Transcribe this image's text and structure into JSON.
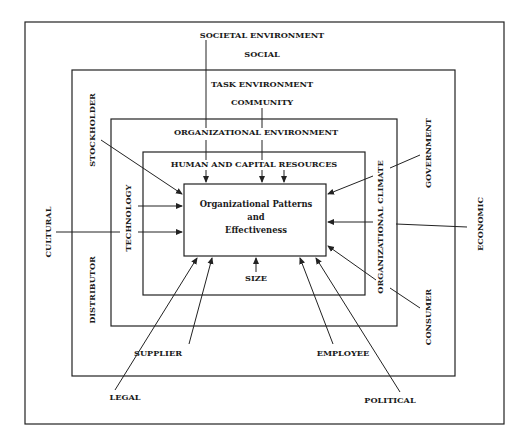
{
  "diagram": {
    "layers": {
      "societal": {
        "title": "SOCIETAL ENVIRONMENT",
        "factor_top": "SOCIAL",
        "factor_left": "CULTURAL",
        "factor_right": "ECONOMIC",
        "factor_bottom_left": "LEGAL",
        "factor_bottom_right": "POLITICAL"
      },
      "task": {
        "title": "TASK ENVIRONMENT",
        "factor_top": "COMMUNITY",
        "factor_left_top": "STOCKHOLDER",
        "factor_left_bottom": "DISTRIBUTOR",
        "factor_right_top": "GOVERNMENT",
        "factor_right_bottom": "CONSUMER",
        "factor_bottom_left": "SUPPLIER",
        "factor_bottom_right": "EMPLOYEE"
      },
      "organizational": {
        "title": "ORGANIZATIONAL ENVIRONMENT",
        "factor_left": "TECHNOLOGY",
        "factor_right": "ORGANIZATIONAL CLIMATE"
      },
      "resources": {
        "title": "HUMAN AND CAPITAL RESOURCES",
        "factor_bottom": "SIZE"
      },
      "core": {
        "line1": "Organizational Patterns",
        "line2": "and",
        "line3": "Effectiveness"
      }
    }
  }
}
